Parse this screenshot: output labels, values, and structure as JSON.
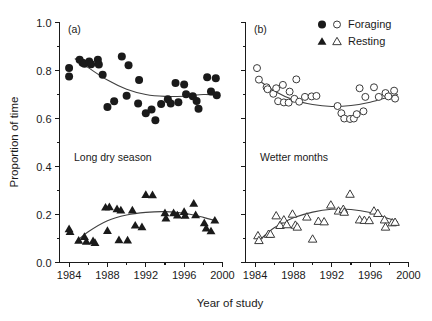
{
  "figure": {
    "xlabel": "Year of study",
    "ylabel": "Proportion of time",
    "panel_a_label": "(a)",
    "panel_b_label": "(b)",
    "panel_a_annotation": "Long dry season",
    "panel_b_annotation": "Wetter months"
  },
  "legend": {
    "position": "top-right",
    "entries": [
      {
        "label": "Foraging",
        "filled_marker": "circle",
        "open_marker": "circle"
      },
      {
        "label": "Resting",
        "filled_marker": "triangle",
        "open_marker": "triangle"
      }
    ]
  },
  "axes": {
    "x_ticks_major": [
      1984,
      1988,
      1992,
      1996,
      2000
    ],
    "x_ticks_minor": [
      1986,
      1990,
      1994,
      1998
    ],
    "x_tick_labels": [
      "1984",
      "1988",
      "1992",
      "1996",
      "2000"
    ],
    "xlim": [
      1983,
      2000
    ],
    "y_ticks_major": [
      0.0,
      0.2,
      0.4,
      0.6,
      0.8,
      1.0
    ],
    "y_ticks_minor": [
      0.1,
      0.3,
      0.5,
      0.7,
      0.9
    ],
    "y_tick_labels": [
      "0.0",
      "0.2",
      "0.4",
      "0.6",
      "0.8",
      "1.0"
    ],
    "ylim": [
      0.0,
      1.0
    ]
  },
  "colors": {
    "ink": "#1a1a1a",
    "curve": "#404040",
    "marker_fill": "#1a1a1a",
    "marker_open_fill": "#ffffff",
    "background": "#ffffff"
  },
  "chart_data": {
    "type": "scatter",
    "title": "",
    "xlabel": "Year of study",
    "ylabel": "Proportion of time",
    "xlim": [
      1983,
      2000
    ],
    "ylim": [
      0.0,
      1.0
    ],
    "grid": false,
    "legend": [
      "Foraging",
      "Resting"
    ],
    "legend_position": "top-right",
    "panels": [
      {
        "id": "a",
        "label": "(a)",
        "annotation": "Long dry season",
        "marker_style": "filled",
        "series": [
          {
            "name": "Foraging",
            "marker": "filled-circle",
            "points": [
              [
                1984.0,
                0.81
              ],
              [
                1984.0,
                0.775
              ],
              [
                1985.1,
                0.845
              ],
              [
                1985.4,
                0.832
              ],
              [
                1985.6,
                0.828
              ],
              [
                1986.1,
                0.838
              ],
              [
                1986.3,
                0.826
              ],
              [
                1987.0,
                0.845
              ],
              [
                1987.1,
                0.825
              ],
              [
                1987.5,
                0.782
              ],
              [
                1988.0,
                0.648
              ],
              [
                1988.7,
                0.672
              ],
              [
                1989.5,
                0.858
              ],
              [
                1990.2,
                0.822
              ],
              [
                1990.0,
                0.695
              ],
              [
                1991.3,
                0.76
              ],
              [
                1991.2,
                0.663
              ],
              [
                1992.0,
                0.622
              ],
              [
                1992.6,
                0.637
              ],
              [
                1993.0,
                0.593
              ],
              [
                1993.6,
                0.66
              ],
              [
                1994.3,
                0.68
              ],
              [
                1994.6,
                0.663
              ],
              [
                1995.1,
                0.748
              ],
              [
                1995.4,
                0.668
              ],
              [
                1996.0,
                0.742
              ],
              [
                1996.2,
                0.701
              ],
              [
                1996.9,
                0.693
              ],
              [
                1997.3,
                0.673
              ],
              [
                1997.5,
                0.641
              ],
              [
                1998.4,
                0.772
              ],
              [
                1998.8,
                0.712
              ],
              [
                1999.3,
                0.768
              ],
              [
                1999.4,
                0.697
              ]
            ],
            "fit_curve": [
              [
                1984.6,
                0.85
              ],
              [
                1986.0,
                0.812
              ],
              [
                1988.0,
                0.76
              ],
              [
                1990.0,
                0.722
              ],
              [
                1992.0,
                0.7
              ],
              [
                1994.0,
                0.692
              ],
              [
                1996.0,
                0.693
              ],
              [
                1998.0,
                0.7
              ],
              [
                1999.6,
                0.698
              ]
            ]
          },
          {
            "name": "Resting",
            "marker": "filled-triangle",
            "points": [
              [
                1984.0,
                0.14
              ],
              [
                1984.1,
                0.128
              ],
              [
                1985.0,
                0.092
              ],
              [
                1985.6,
                0.108
              ],
              [
                1985.8,
                0.088
              ],
              [
                1986.5,
                0.09
              ],
              [
                1986.7,
                0.083
              ],
              [
                1987.8,
                0.23
              ],
              [
                1988.2,
                0.232
              ],
              [
                1988.0,
                0.133
              ],
              [
                1989.0,
                0.223
              ],
              [
                1989.4,
                0.218
              ],
              [
                1989.2,
                0.094
              ],
              [
                1990.1,
                0.093
              ],
              [
                1990.6,
                0.218
              ],
              [
                1990.9,
                0.155
              ],
              [
                1992.0,
                0.283
              ],
              [
                1992.7,
                0.282
              ],
              [
                1991.6,
                0.148
              ],
              [
                1994.0,
                0.207
              ],
              [
                1994.1,
                0.185
              ],
              [
                1994.9,
                0.207
              ],
              [
                1995.3,
                0.197
              ],
              [
                1996.0,
                0.212
              ],
              [
                1996.1,
                0.196
              ],
              [
                1997.0,
                0.246
              ],
              [
                1997.2,
                0.198
              ],
              [
                1998.1,
                0.165
              ],
              [
                1998.3,
                0.143
              ],
              [
                1998.8,
                0.131
              ],
              [
                1999.2,
                0.176
              ]
            ],
            "fit_curve": [
              [
                1984.7,
                0.085
              ],
              [
                1986.0,
                0.128
              ],
              [
                1988.0,
                0.174
              ],
              [
                1990.0,
                0.198
              ],
              [
                1992.0,
                0.209
              ],
              [
                1994.0,
                0.212
              ],
              [
                1996.0,
                0.205
              ],
              [
                1998.0,
                0.188
              ],
              [
                1999.3,
                0.174
              ]
            ]
          }
        ]
      },
      {
        "id": "b",
        "label": "(b)",
        "annotation": "Wetter months",
        "marker_style": "open",
        "series": [
          {
            "name": "Foraging",
            "marker": "open-circle",
            "points": [
              [
                1984.2,
                0.81
              ],
              [
                1984.4,
                0.762
              ],
              [
                1985.2,
                0.73
              ],
              [
                1985.3,
                0.722
              ],
              [
                1985.9,
                0.703
              ],
              [
                1986.2,
                0.726
              ],
              [
                1986.4,
                0.672
              ],
              [
                1987.0,
                0.667
              ],
              [
                1986.9,
                0.74
              ],
              [
                1987.6,
                0.712
              ],
              [
                1987.5,
                0.666
              ],
              [
                1988.1,
                0.682
              ],
              [
                1988.3,
                0.763
              ],
              [
                1988.6,
                0.67
              ],
              [
                1989.2,
                0.69
              ],
              [
                1989.9,
                0.692
              ],
              [
                1990.4,
                0.694
              ],
              [
                1992.6,
                0.652
              ],
              [
                1993.0,
                0.622
              ],
              [
                1993.3,
                0.6
              ],
              [
                1993.9,
                0.598
              ],
              [
                1994.3,
                0.6
              ],
              [
                1994.6,
                0.618
              ],
              [
                1994.9,
                0.726
              ],
              [
                1995.5,
                0.69
              ],
              [
                1995.3,
                0.63
              ],
              [
                1996.4,
                0.73
              ],
              [
                1996.9,
                0.69
              ],
              [
                1997.6,
                0.706
              ],
              [
                1997.9,
                0.692
              ],
              [
                1998.5,
                0.716
              ],
              [
                1998.6,
                0.683
              ]
            ],
            "fit_curve": [
              [
                1984.5,
                0.756
              ],
              [
                1986.0,
                0.715
              ],
              [
                1988.0,
                0.678
              ],
              [
                1990.0,
                0.658
              ],
              [
                1992.0,
                0.65
              ],
              [
                1994.0,
                0.654
              ],
              [
                1996.0,
                0.668
              ],
              [
                1998.0,
                0.69
              ],
              [
                1998.9,
                0.7
              ]
            ]
          },
          {
            "name": "Resting",
            "marker": "open-triangle",
            "points": [
              [
                1984.3,
                0.112
              ],
              [
                1984.4,
                0.092
              ],
              [
                1985.4,
                0.118
              ],
              [
                1985.6,
                0.118
              ],
              [
                1986.2,
                0.195
              ],
              [
                1986.6,
                0.155
              ],
              [
                1987.0,
                0.178
              ],
              [
                1987.3,
                0.158
              ],
              [
                1987.9,
                0.202
              ],
              [
                1988.2,
                0.156
              ],
              [
                1988.4,
                0.148
              ],
              [
                1989.4,
                0.19
              ],
              [
                1990.0,
                0.098
              ],
              [
                1990.6,
                0.172
              ],
              [
                1991.2,
                0.17
              ],
              [
                1991.9,
                0.24
              ],
              [
                1992.7,
                0.215
              ],
              [
                1993.2,
                0.222
              ],
              [
                1993.3,
                0.21
              ],
              [
                1993.9,
                0.285
              ],
              [
                1994.9,
                0.178
              ],
              [
                1995.4,
                0.176
              ],
              [
                1995.9,
                0.175
              ],
              [
                1996.4,
                0.215
              ],
              [
                1996.8,
                0.205
              ],
              [
                1997.5,
                0.178
              ],
              [
                1997.6,
                0.148
              ],
              [
                1998.3,
                0.166
              ],
              [
                1998.6,
                0.168
              ]
            ],
            "fit_curve": [
              [
                1984.6,
                0.098
              ],
              [
                1986.0,
                0.145
              ],
              [
                1988.0,
                0.186
              ],
              [
                1990.0,
                0.21
              ],
              [
                1992.0,
                0.222
              ],
              [
                1994.0,
                0.221
              ],
              [
                1996.0,
                0.208
              ],
              [
                1998.0,
                0.182
              ],
              [
                1998.9,
                0.168
              ]
            ]
          }
        ]
      }
    ]
  }
}
